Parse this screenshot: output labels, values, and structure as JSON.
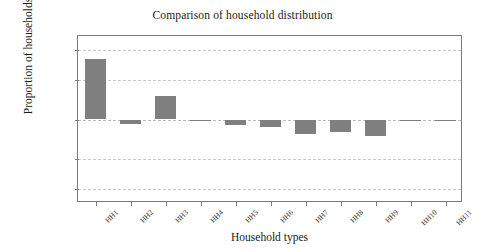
{
  "chart_data": {
    "type": "bar",
    "title": "Comparison of household distribution",
    "xlabel": "Household types",
    "ylabel": "Proportion of households",
    "categories": [
      "HH1",
      "HH2",
      "HH3",
      "HH4",
      "HH5",
      "HH6",
      "HH7",
      "HH8",
      "HH9",
      "HH10",
      "HH11"
    ],
    "values": [
      0.00305,
      -0.00022,
      0.0012,
      -8e-05,
      -0.00028,
      -0.0004,
      -0.00072,
      -0.00063,
      -0.00082,
      0.0,
      0.0
    ],
    "ylim": [
      -0.0042,
      0.0042
    ],
    "yticks": [
      0.0035,
      0.002,
      0,
      -0.002,
      -0.0035
    ],
    "ytick_labels": [
      "0.0035",
      "0.002",
      "0",
      "-0.002",
      "-0.0035"
    ],
    "grid": true,
    "legend": false,
    "bar_color": "#7f7f7f",
    "axis_color": "#7a7a7a",
    "grid_color": "#c9c9c9"
  }
}
